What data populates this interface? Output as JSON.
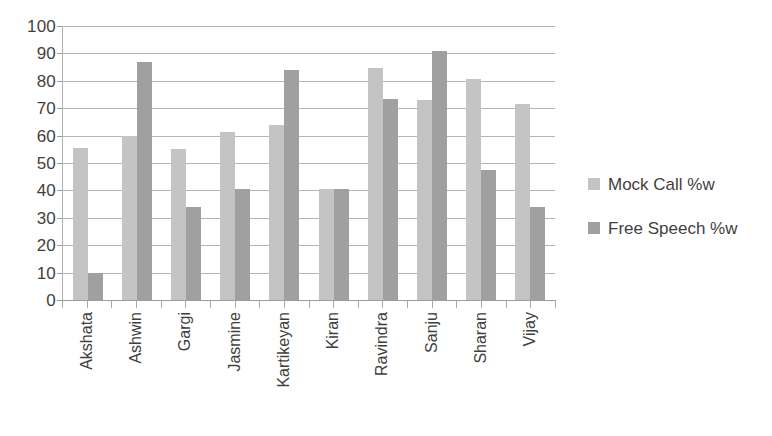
{
  "chart_data": {
    "type": "bar",
    "title": "",
    "subtitle": "",
    "xlabel": "",
    "ylabel": "",
    "ylim": [
      0,
      100
    ],
    "ytick_step": 10,
    "yticks": [
      100,
      90,
      80,
      70,
      60,
      50,
      40,
      30,
      20,
      10,
      0
    ],
    "grid": true,
    "legend_position": "right",
    "categories": [
      "Akshata",
      "Ashwin",
      "Gargi",
      "Jasmine",
      "Kartikeyan",
      "Kiran",
      "Ravindra",
      "Sanju",
      "Sharan",
      "Vijay"
    ],
    "series": [
      {
        "name": "Mock Call %w",
        "color": "#c4c4c4",
        "values": [
          55.5,
          60,
          55,
          61.5,
          64,
          40.5,
          84.5,
          73,
          80.5,
          71.5
        ]
      },
      {
        "name": "Free Speech %w",
        "color": "#a0a0a0",
        "values": [
          10,
          87,
          34,
          40.5,
          84,
          40.5,
          73.5,
          91,
          47.5,
          34
        ]
      }
    ]
  },
  "legend": {
    "items": [
      {
        "label": "Mock Call %w",
        "color": "#c4c4c4"
      },
      {
        "label": "Free Speech %w",
        "color": "#a0a0a0"
      }
    ]
  },
  "colors": {
    "series_0": "#c4c4c4",
    "series_1": "#a0a0a0",
    "gridline": "#b5b5b5",
    "axis": "#9c9c9c",
    "text": "#3f3f3f",
    "background": "#ffffff"
  }
}
